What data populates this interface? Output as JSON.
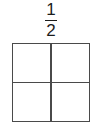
{
  "figure": {
    "title": "",
    "background_color": "#ffffff",
    "line_color": "#4a4a4a",
    "text_color": "#1c1c1c"
  },
  "fraction_label": {
    "numerator": "1",
    "denominator": "2",
    "bar": "",
    "reading": "1/2"
  },
  "shape": {
    "kind": "square",
    "total_parts": "4",
    "rows": "2",
    "columns": "2",
    "shaded_parts": "0",
    "cells": [
      {
        "position": "top-left",
        "shaded": "no",
        "fill": "#ffffff",
        "label": ""
      },
      {
        "position": "top-right",
        "shaded": "no",
        "fill": "#ffffff",
        "label": ""
      },
      {
        "position": "bottom-left",
        "shaded": "no",
        "fill": "#ffffff",
        "label": ""
      },
      {
        "position": "bottom-right",
        "shaded": "no",
        "fill": "#ffffff",
        "label": ""
      }
    ]
  }
}
